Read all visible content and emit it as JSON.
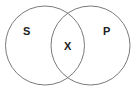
{
  "diagram": {
    "type": "venn",
    "sets": [
      {
        "label": "S",
        "cx": 45,
        "cy": 45.5,
        "r": 39.5
      },
      {
        "label": "P",
        "cx": 90.5,
        "cy": 45.5,
        "r": 39.5
      }
    ],
    "intersection_label": "X",
    "stroke_color": "#7a7a7a"
  }
}
